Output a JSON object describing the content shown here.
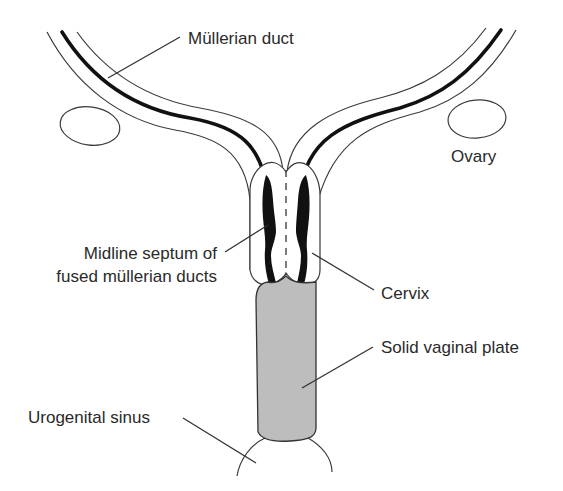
{
  "diagram": {
    "labels": {
      "mullerian_duct": "Müllerian duct",
      "ovary": "Ovary",
      "midline_septum_line1": "Midline septum of",
      "midline_septum_line2": "fused müllerian ducts",
      "cervix": "Cervix",
      "solid_vaginal_plate": "Solid vaginal plate",
      "urogenital_sinus": "Urogenital sinus"
    },
    "colors": {
      "background": "#ffffff",
      "outline": "#3a3a3a",
      "duct_lumen": "#111111",
      "vaginal_plate_fill": "#bdbdbd",
      "text": "#2a2a2a"
    }
  }
}
